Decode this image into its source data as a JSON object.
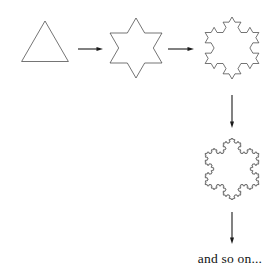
{
  "figure": {
    "name": "koch-snowflake-construction",
    "background_color": "#ffffff",
    "stroke_color": "#3a3a3a",
    "arrow_color": "#1a1a1a",
    "caption": "and so on...",
    "caption_color": "#111111",
    "stages": [
      {
        "id": "stage-0",
        "label": "equilateral-triangle",
        "iteration": 0,
        "center_x": 45,
        "center_y": 48,
        "radius": 27,
        "rotation_deg": -90,
        "segments": 3
      },
      {
        "id": "stage-1",
        "label": "six-pointed-star",
        "iteration": 1,
        "center_x": 136,
        "center_y": 48,
        "radius": 30,
        "rotation_deg": -90,
        "segments": 12
      },
      {
        "id": "stage-2",
        "label": "koch-snowflake-iteration-2",
        "iteration": 2,
        "center_x": 232,
        "center_y": 48,
        "radius": 31,
        "rotation_deg": -90,
        "segments": 48
      },
      {
        "id": "stage-3",
        "label": "koch-snowflake-iteration-4",
        "iteration": 4,
        "center_x": 232,
        "center_y": 169,
        "radius": 31,
        "rotation_deg": -90,
        "segments": 768
      }
    ],
    "arrows": [
      {
        "id": "arrow-1",
        "label": "arrow-triangle-to-star",
        "direction": "right",
        "x1": 78,
        "y1": 49,
        "x2": 103,
        "y2": 49
      },
      {
        "id": "arrow-2",
        "label": "arrow-star-to-snowflake",
        "direction": "right",
        "x1": 168,
        "y1": 49,
        "x2": 194,
        "y2": 49
      },
      {
        "id": "arrow-3",
        "label": "arrow-snowflake-down",
        "direction": "down",
        "x1": 232,
        "y1": 95,
        "x2": 232,
        "y2": 128
      },
      {
        "id": "arrow-4",
        "label": "arrow-to-caption",
        "direction": "down",
        "x1": 232,
        "y1": 212,
        "x2": 232,
        "y2": 244
      }
    ],
    "caption_position": {
      "x": 230,
      "y": 263,
      "anchor": "middle"
    }
  }
}
